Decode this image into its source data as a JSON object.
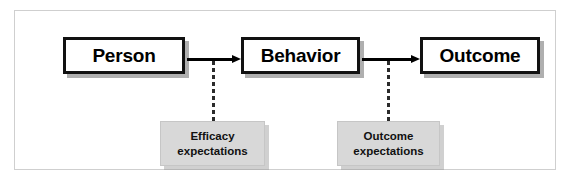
{
  "diagram": {
    "frame_color": "#cfcfcf",
    "background_color": "#ffffff"
  },
  "concepts": [
    {
      "id": "person",
      "label": "Person",
      "fill": "#ffffff",
      "border": "#111111"
    },
    {
      "id": "behavior",
      "label": "Behavior",
      "fill": "#ffffff",
      "border": "#111111"
    },
    {
      "id": "outcome",
      "label": "Outcome",
      "fill": "#ffffff",
      "border": "#111111"
    }
  ],
  "expectations": [
    {
      "id": "efficacy-expectations",
      "line1": "Efficacy",
      "line2": "expectations",
      "fill": "#d8d8d8",
      "attached_to_arrow": "person-to-behavior"
    },
    {
      "id": "outcome-expectations",
      "line1": "Outcome",
      "line2": "expectations",
      "fill": "#d8d8d8",
      "attached_to_arrow": "behavior-to-outcome"
    }
  ],
  "arrows": [
    {
      "id": "person-to-behavior",
      "from": "Person",
      "to": "Behavior",
      "style": "solid",
      "color": "#000000"
    },
    {
      "id": "behavior-to-outcome",
      "from": "Behavior",
      "to": "Outcome",
      "style": "solid",
      "color": "#000000"
    }
  ],
  "connectors": [
    {
      "id": "efficacy-connector",
      "style": "dashed",
      "color": "#2b2b2b"
    },
    {
      "id": "outcome-connector",
      "style": "dashed",
      "color": "#2b2b2b"
    }
  ]
}
